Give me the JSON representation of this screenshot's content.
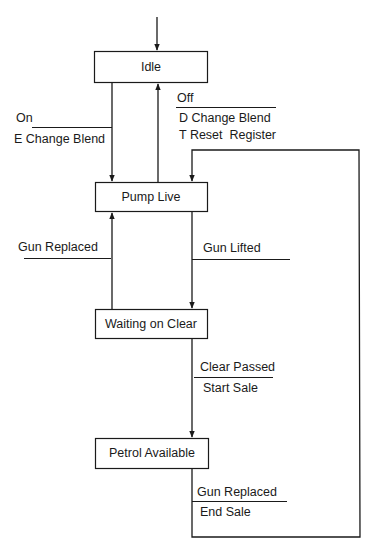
{
  "diagram": {
    "type": "state-transition",
    "states": [
      {
        "id": "idle",
        "label": "Idle"
      },
      {
        "id": "pump-live",
        "label": "Pump Live"
      },
      {
        "id": "waiting-on-clear",
        "label": "Waiting on Clear"
      },
      {
        "id": "petrol-available",
        "label": "Petrol Available"
      }
    ],
    "transitions": [
      {
        "id": "on",
        "from": "idle",
        "to": "pump-live",
        "event": "On",
        "actions": [
          "E Change Blend"
        ]
      },
      {
        "id": "off",
        "from": "pump-live",
        "to": "idle",
        "event": "Off",
        "actions": [
          "D Change Blend",
          "T Reset  Register"
        ]
      },
      {
        "id": "gun-replaced-1",
        "from": "waiting-on-clear",
        "to": "pump-live",
        "event": "Gun Replaced",
        "actions": []
      },
      {
        "id": "gun-lifted",
        "from": "pump-live",
        "to": "waiting-on-clear",
        "event": "Gun Lifted",
        "actions": []
      },
      {
        "id": "clear-passed",
        "from": "waiting-on-clear",
        "to": "petrol-available",
        "event": "Clear Passed",
        "actions": [
          "Start Sale"
        ]
      },
      {
        "id": "gun-replaced-2",
        "from": "petrol-available",
        "to": "pump-live",
        "event": "Gun Replaced",
        "actions": [
          "End Sale"
        ]
      }
    ]
  }
}
